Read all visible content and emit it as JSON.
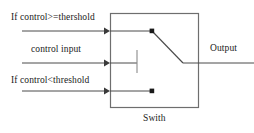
{
  "figure": {
    "caption": "Swith",
    "block_name": "Swith"
  },
  "labels": {
    "condition_high": "If  control>=thershold",
    "control_input": "control  input",
    "condition_low": "If  control<threshold",
    "output": "Output"
  },
  "colors": {
    "line": "#4a4a4a",
    "box_border": "#6e6e6e",
    "text": "#1a1a1a",
    "terminal": "#1a1a1a",
    "background": "#ffffff"
  },
  "diagram": {
    "type": "schematic-switch",
    "box": {
      "x": 110,
      "y": 13,
      "width": 89,
      "height": 95
    },
    "inputs": [
      {
        "name": "condition-high-input",
        "label": "If  control>=thershold",
        "y": 31,
        "x_start": 22,
        "x_end": 110,
        "arrow": true
      },
      {
        "name": "control-input",
        "label": "control  input",
        "y": 63,
        "x_start": 22,
        "x_end": 110,
        "arrow": true
      },
      {
        "name": "condition-low-input",
        "label": "If  control<threshold",
        "y": 91,
        "x_start": 22,
        "x_end": 110,
        "arrow": true
      }
    ],
    "terminals": [
      {
        "name": "upper-terminal",
        "x": 152,
        "y": 31
      },
      {
        "name": "lower-terminal",
        "x": 152,
        "y": 91
      }
    ],
    "switch_blade": {
      "from_x": 152,
      "from_y": 31,
      "to_x": 183,
      "to_y": 63,
      "state": "upper"
    },
    "control_tick": {
      "x": 137,
      "y_top": 50,
      "y_bottom": 73
    },
    "output_line": {
      "y": 63,
      "x_start": 183,
      "x_end": 254
    }
  }
}
